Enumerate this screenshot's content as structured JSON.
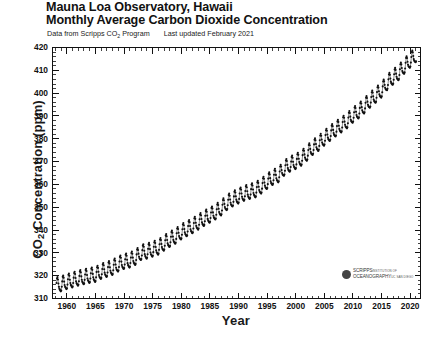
{
  "title": {
    "line1": "Mauna Loa Observatory, Hawaii",
    "line2": "Monthly Average Carbon Dioxide Concentration"
  },
  "subtitle": {
    "source_prefix": "Data from Scripps CO",
    "source_sub": "2",
    "source_suffix": " Program",
    "updated": "Last updated February 2021"
  },
  "logo": {
    "line1": "SCRIPPS",
    "line1_small": "INSTITUTION OF",
    "line2": "OCEANOGRAPHY",
    "line2_small": "UC SAN DIEGO"
  },
  "chart_data": {
    "type": "line",
    "subtitle": "Data from Scripps CO2 Program. Last updated February 2021",
    "xlabel": "Year",
    "ylabel": "CO2 Concentration (ppm)",
    "xlim": [
      1957.5,
      2021.8
    ],
    "ylim": [
      310,
      420
    ],
    "xticks": [
      1960,
      1965,
      1970,
      1975,
      1980,
      1985,
      1990,
      1995,
      2000,
      2005,
      2010,
      2015,
      2020
    ],
    "yticks": [
      310,
      320,
      330,
      340,
      350,
      360,
      370,
      380,
      390,
      400,
      410,
      420
    ],
    "x_minor_step": 1,
    "y_minor_step": 2,
    "grid": false,
    "legend": "none",
    "marker": "filled-circle",
    "marker_color": "#111111",
    "series_name": "Monthly mean CO2 (ppm)",
    "seasonal_amplitude_ppm": 3.1,
    "seasonal_peak_month": 5,
    "seasonal_min_month": 9,
    "annual_trend_x": [
      1958,
      1959,
      1960,
      1961,
      1962,
      1963,
      1964,
      1965,
      1966,
      1967,
      1968,
      1969,
      1970,
      1971,
      1972,
      1973,
      1974,
      1975,
      1976,
      1977,
      1978,
      1979,
      1980,
      1981,
      1982,
      1983,
      1984,
      1985,
      1986,
      1987,
      1988,
      1989,
      1990,
      1991,
      1992,
      1993,
      1994,
      1995,
      1996,
      1997,
      1998,
      1999,
      2000,
      2001,
      2002,
      2003,
      2004,
      2005,
      2006,
      2007,
      2008,
      2009,
      2010,
      2011,
      2012,
      2013,
      2014,
      2015,
      2016,
      2017,
      2018,
      2019,
      2020,
      2021
    ],
    "annual_trend_y": [
      315.3,
      315.9,
      316.9,
      317.6,
      318.4,
      319.0,
      319.6,
      320.0,
      321.4,
      322.2,
      323.1,
      324.6,
      325.7,
      326.3,
      327.5,
      329.7,
      330.2,
      331.1,
      332.0,
      333.8,
      335.4,
      336.8,
      338.7,
      340.1,
      341.4,
      343.0,
      344.6,
      346.0,
      347.4,
      349.2,
      351.6,
      353.1,
      354.4,
      355.6,
      356.4,
      357.1,
      358.8,
      360.8,
      362.6,
      363.7,
      366.7,
      368.4,
      369.5,
      371.0,
      373.2,
      375.8,
      377.5,
      379.8,
      381.9,
      383.8,
      385.6,
      387.4,
      389.9,
      391.7,
      393.9,
      396.5,
      398.6,
      400.9,
      404.2,
      406.5,
      408.5,
      411.4,
      414.0,
      416.4
    ],
    "first_point": {
      "year": 1958.2,
      "value": 315.7
    },
    "last_point": {
      "year": 2021.1,
      "value": 416.4
    },
    "min_value": 312.4,
    "max_value": 417.3,
    "n_points": 756
  }
}
